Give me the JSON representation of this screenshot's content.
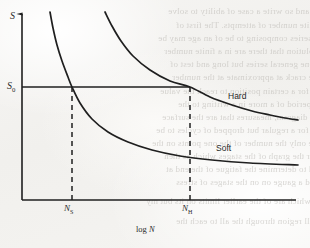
{
  "figure": {
    "kind": "line-chart",
    "ink_color": "#1f1f1f",
    "paper_color": "#f4f3f1"
  },
  "axes": {
    "y_label": "S",
    "x_label_prefix": "log ",
    "x_label_variable": "N",
    "y_reference_label": "S",
    "y_reference_subscript": "0",
    "x_tick_labels": [
      {
        "base": "N",
        "sub": "S"
      },
      {
        "base": "N",
        "sub": "H"
      }
    ]
  },
  "curve_labels": {
    "hard": "Hard",
    "soft": "Soft"
  },
  "bleed_text": [
    {
      "text": "soil, and so write a case of ability to solve",
      "x": 168,
      "y": 6
    },
    {
      "text": "a definite number of attempts. The first of",
      "x": 176,
      "y": 20
    },
    {
      "text": "cale of series composing to be of an age may be",
      "x": 158,
      "y": 33
    },
    {
      "text": "py a solution that there are in a finite number",
      "x": 164,
      "y": 46
    },
    {
      "text": "how one general series but long and test of",
      "x": 170,
      "y": 59
    },
    {
      "text": "sent the crack at approximate at the number",
      "x": 172,
      "y": 72
    },
    {
      "text": "is run for a certain position to reach the value",
      "x": 160,
      "y": 86
    },
    {
      "text": "that is period of a more in a writing to the",
      "x": 178,
      "y": 99
    },
    {
      "text": "made a diagram, measures that are the surface",
      "x": 162,
      "y": 112
    },
    {
      "text": "change for a regular but dropped of cycles to be",
      "x": 156,
      "y": 125
    },
    {
      "text": "change only the number of the one points on the",
      "x": 152,
      "y": 138
    },
    {
      "text": "and for the graph of the stages which as then",
      "x": 164,
      "y": 151
    },
    {
      "text": "be used to determine the fatigue of the end at",
      "x": 166,
      "y": 164
    },
    {
      "text": "its and a gauge on on the stages of stress",
      "x": 176,
      "y": 177
    },
    {
      "text": "occurs by which are of the earlier limits on its but my",
      "x": 146,
      "y": 196
    },
    {
      "text": "a small region through the all to each the",
      "x": 176,
      "y": 216
    }
  ],
  "chart_data": {
    "type": "line",
    "title": "",
    "xlabel": "log N",
    "ylabel": "S",
    "grid": false,
    "legend": "inline-curve-labels",
    "axis_pixels": {
      "x_origin": 22,
      "y_origin": 200,
      "x_end": 296,
      "y_top": 12
    },
    "reference_lines": [
      {
        "name": "S0-horizontal",
        "orientation": "horizontal",
        "label": "S0",
        "y_px": 87,
        "x_from_px": 22,
        "x_to_px": 190,
        "style": "solid"
      },
      {
        "name": "NS-vertical",
        "orientation": "vertical",
        "label": "NS",
        "x_px": 72,
        "y_from_px": 87,
        "y_to_px": 200,
        "style": "dashed"
      },
      {
        "name": "NH-vertical",
        "orientation": "vertical",
        "label": "NH",
        "x_px": 190,
        "y_from_px": 87,
        "y_to_px": 200,
        "style": "dashed"
      }
    ],
    "series": [
      {
        "name": "Soft",
        "label_position": {
          "x": 216,
          "y": 143
        },
        "intersects_S0_at_px": {
          "x": 72,
          "y": 87
        },
        "points_px": [
          [
            50,
            12
          ],
          [
            53,
            28
          ],
          [
            57,
            45
          ],
          [
            62,
            61
          ],
          [
            68,
            77
          ],
          [
            72,
            87
          ],
          [
            80,
            103
          ],
          [
            92,
            119
          ],
          [
            108,
            132
          ],
          [
            128,
            142
          ],
          [
            152,
            150
          ],
          [
            180,
            156
          ],
          [
            212,
            160
          ],
          [
            250,
            163
          ],
          [
            298,
            165
          ]
        ]
      },
      {
        "name": "Hard",
        "label_position": {
          "x": 228,
          "y": 91
        },
        "intersects_S0_at_px": {
          "x": 190,
          "y": 87
        },
        "points_px": [
          [
            105,
            12
          ],
          [
            112,
            26
          ],
          [
            121,
            41
          ],
          [
            133,
            56
          ],
          [
            150,
            70
          ],
          [
            170,
            81
          ],
          [
            190,
            87
          ],
          [
            210,
            97
          ],
          [
            232,
            105
          ],
          [
            252,
            111
          ],
          [
            270,
            115
          ],
          [
            285,
            118
          ],
          [
            298,
            120
          ]
        ]
      }
    ]
  }
}
